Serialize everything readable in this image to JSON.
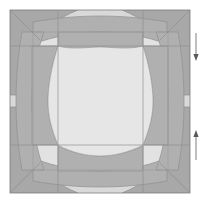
{
  "figure": {
    "canvas": {
      "width": 210,
      "height": 205
    },
    "panel": {
      "x": 10,
      "y": 10,
      "width": 180,
      "height": 183
    },
    "colors": {
      "background": "#ffffff",
      "panel_light": "#dcdcdc",
      "panel_lighter": "#e4e4e4",
      "pattern_dark": "#a8a8a8",
      "pattern_mid": "#b4b4b4",
      "center_fill": "#e6e6e6",
      "outline": "#8a8a8a",
      "construction_line": "#9a9a9a",
      "arrow": "#6e6e6e"
    },
    "grid": {
      "vertical_lines": [
        58,
        143
      ],
      "horizontal_lines": [
        46,
        145
      ],
      "inner_vertical_lines": [
        33,
        168
      ],
      "inner_horizontal_lines": [
        32,
        170
      ]
    },
    "center_square": {
      "x": 58,
      "y": 46,
      "width": 85,
      "height": 99
    },
    "shapes": [
      {
        "name": "corner-flare-top-left",
        "tone": "dark"
      },
      {
        "name": "corner-flare-top-right",
        "tone": "dark"
      },
      {
        "name": "corner-flare-bottom-left",
        "tone": "dark"
      },
      {
        "name": "corner-flare-bottom-right",
        "tone": "dark"
      },
      {
        "name": "edge-band-top",
        "tone": "mid"
      },
      {
        "name": "edge-band-bottom",
        "tone": "mid"
      },
      {
        "name": "edge-band-left",
        "tone": "mid"
      },
      {
        "name": "edge-band-right",
        "tone": "mid"
      }
    ],
    "annotations": {
      "arrows": [
        {
          "name": "dimension-arrow-top",
          "direction": "down",
          "x": 196,
          "y_start": 33,
          "y_end": 60
        },
        {
          "name": "dimension-arrow-bottom",
          "direction": "up",
          "x": 196,
          "y_start": 160,
          "y_end": 131
        }
      ]
    }
  }
}
